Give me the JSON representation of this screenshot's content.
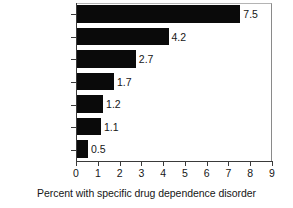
{
  "chart_data": {
    "type": "bar",
    "orientation": "horizontal",
    "title": "",
    "subtitle": "",
    "xlabel": "Percent with specific drug dependence disorder",
    "ylabel": "",
    "xlim": [
      0,
      9
    ],
    "xticks": [
      0,
      1,
      2,
      3,
      4,
      5,
      6,
      7,
      8,
      9
    ],
    "grid": false,
    "legend": false,
    "bar_color": "#0a0a0a",
    "frame_color": "#8a8a8a",
    "axis_color": "#3a3a3a",
    "categories": [
      "Any drug",
      "Cannabis",
      "Cocaine",
      "Stimulants",
      "Sedatives",
      "Opioids",
      "Hallucinogens"
    ],
    "values": [
      7.5,
      4.2,
      2.7,
      1.7,
      1.2,
      1.1,
      0.5
    ],
    "value_labels": [
      "7.5",
      "4.2",
      "2.7",
      "1.7",
      "1.2",
      "1.1",
      "0.5"
    ],
    "xtick_labels": [
      "0",
      "1",
      "2",
      "3",
      "4",
      "5",
      "6",
      "7",
      "8",
      "9"
    ]
  }
}
